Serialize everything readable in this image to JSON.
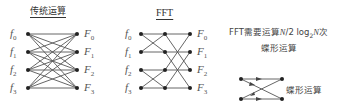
{
  "traditional": {
    "title": "传统运算",
    "inputs": [
      "f",
      "f",
      "f",
      "f"
    ],
    "input_subs": [
      "0",
      "1",
      "2",
      "3"
    ],
    "outputs": [
      "F",
      "F",
      "F",
      "F"
    ],
    "output_subs": [
      "0",
      "1",
      "2",
      "3"
    ]
  },
  "fft": {
    "title": "FFT",
    "inputs": [
      "f",
      "f",
      "f",
      "f"
    ],
    "input_subs": [
      "0",
      "1",
      "2",
      "3"
    ],
    "outputs": [
      "F",
      "F",
      "F",
      "F"
    ],
    "output_subs": [
      "0",
      "1",
      "2",
      "3"
    ]
  },
  "note": {
    "line1_prefix": "FFT需要运算",
    "line1_formula_a": "N",
    "line1_formula_b": "/2 log",
    "line1_formula_sub": "2",
    "line1_formula_c": "N",
    "line1_suffix": "次",
    "line2": "蝶形运算"
  },
  "butterfly": {
    "label": "蝶形运算"
  },
  "colors": {
    "line": "#444444",
    "node": "#222222",
    "text": "#333333"
  }
}
